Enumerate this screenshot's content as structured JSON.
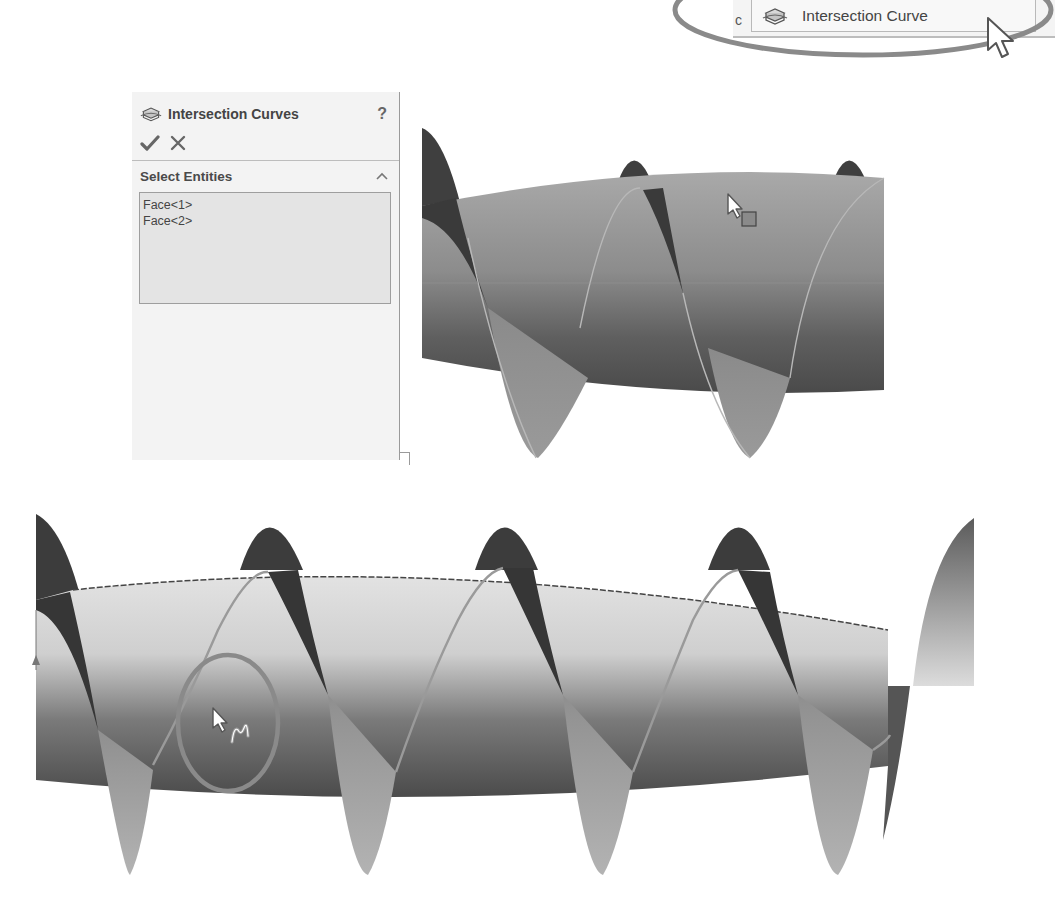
{
  "menu": {
    "clipped_text": "c",
    "item_label": "Intersection Curve",
    "item_icon": "intersection-curve-icon",
    "highlight_color": "#8a8a8a"
  },
  "property_manager": {
    "title": "Intersection Curves",
    "title_icon": "intersection-curve-icon",
    "help_label": "?",
    "ok_icon": "checkmark-icon",
    "cancel_icon": "close-icon",
    "section": {
      "title": "Select Entities",
      "collapse_icon": "chevron-up-icon",
      "selections": [
        "Face<1>",
        "Face<2>"
      ]
    }
  },
  "viewport_top": {
    "description": "Helical surface intersecting a barrel-shaped face, preview state",
    "cursor": "arrow-with-face-filter-icon"
  },
  "viewport_bottom": {
    "description": "Resulting intersection curve (helix) on barrel face, highlighted",
    "cursor": "arrow-with-curve-filter-icon",
    "highlight_circle_color": "#8a8a8a"
  }
}
